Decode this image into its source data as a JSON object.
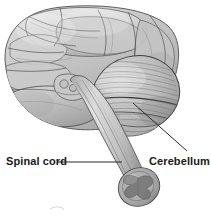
{
  "figure": {
    "kind": "anatomical-illustration",
    "view": "inferolateral",
    "width": 211,
    "height": 216,
    "background_color": "#ffffff"
  },
  "labels": [
    {
      "id": "spinal-cord",
      "text": "Spinal cord",
      "color": "#1a1a1a",
      "bold": true,
      "x": 6,
      "y": 155,
      "leader": {
        "style": "straight",
        "from_x": 57,
        "from_y": 162,
        "to_x": 122,
        "to_y": 162
      }
    },
    {
      "id": "cerebellum",
      "text": "Cerebellum",
      "color": "#1a1a1a",
      "bold": true,
      "x": 149,
      "y": 155,
      "leader": {
        "style": "straight",
        "from_x": 187,
        "from_y": 151,
        "to_x": 133,
        "to_y": 103
      }
    }
  ],
  "structures": [
    {
      "id": "cerebrum",
      "name": "Cerebrum",
      "fill": "#c2c2c2",
      "outline": "#4a4a4a"
    },
    {
      "id": "temporal-lobe",
      "name": "Temporal lobe",
      "fill": "#b8b8b8",
      "outline": "#4a4a4a"
    },
    {
      "id": "frontal-lobe",
      "name": "Frontal lobe",
      "fill": "#c8c8c8",
      "outline": "#555555"
    },
    {
      "id": "cerebellum",
      "name": "Cerebellum",
      "fill": "#bdbdbd",
      "outline": "#3f3f3f"
    },
    {
      "id": "brainstem",
      "name": "Brainstem",
      "fill": "#cacaca",
      "outline": "#5a5a5a"
    },
    {
      "id": "spinal-cord",
      "name": "Spinal cord",
      "fill": "#c6c6c6",
      "outline": "#555555"
    },
    {
      "id": "spinal-cord-cross-section",
      "name": "Spinal cord cross section",
      "fill": "#a8a8a8",
      "outline": "#4a4a4a"
    },
    {
      "id": "gray-matter-butterfly",
      "name": "Gray matter",
      "fill": "#7e7e7e",
      "outline": "#5a5a5a"
    },
    {
      "id": "mammillary-bodies",
      "name": "Mammillary bodies",
      "fill": "#c0c0c0",
      "outline": "#5a5a5a"
    }
  ],
  "palette": {
    "ink": "#1a1a1a",
    "leader_line": "#2b2b2b",
    "light_gray": "#dcdcdc",
    "mid_gray": "#bfbfbf",
    "dark_gray": "#8a8a8a",
    "outline": "#4a4a4a"
  }
}
